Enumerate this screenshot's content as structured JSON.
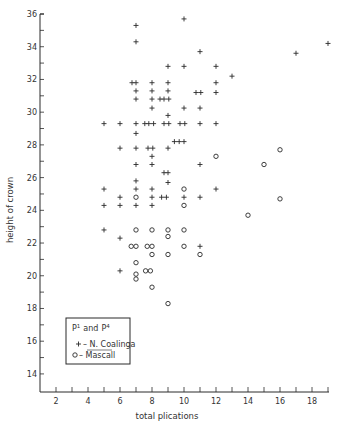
{
  "chart_data": {
    "type": "scatter",
    "title": "",
    "xlabel": "total plications",
    "ylabel": "height of crown",
    "xlim": [
      1,
      19
    ],
    "ylim": [
      12.9,
      36
    ],
    "xticks_labeled": [
      2,
      4,
      6,
      8,
      10,
      12,
      14,
      16,
      18
    ],
    "xticks_minor": [
      1,
      2,
      3,
      4,
      5,
      6,
      7,
      8,
      9,
      10,
      11,
      12,
      13,
      14,
      15,
      16,
      17,
      18,
      19
    ],
    "yticks_labeled": [
      14,
      16,
      18,
      20,
      22,
      24,
      26,
      28,
      30,
      32,
      34,
      36
    ],
    "yticks_minor": [
      14,
      15,
      16,
      17,
      18,
      19,
      20,
      21,
      22,
      23,
      24,
      25,
      26,
      27,
      28,
      29,
      30,
      31,
      32,
      33,
      34,
      35,
      36
    ],
    "grid": false,
    "legend": {
      "position": "lower-left",
      "title": "P1 and P4",
      "title_parts": {
        "p": "P",
        "sup1": "1",
        "and": "and",
        "sup2": "4"
      },
      "entries": [
        {
          "marker": "+",
          "label": "N. Coalinga"
        },
        {
          "marker": "o",
          "label": "Mascall"
        }
      ]
    },
    "series": [
      {
        "name": "N. Coalinga",
        "marker": "+",
        "points": [
          [
            7,
            35.3
          ],
          [
            7,
            34.3
          ],
          [
            10,
            35.7
          ],
          [
            11,
            33.7
          ],
          [
            17,
            33.6
          ],
          [
            19,
            34.2
          ],
          [
            9,
            32.8
          ],
          [
            10,
            32.8
          ],
          [
            12,
            32.8
          ],
          [
            13,
            32.2
          ],
          [
            6.75,
            31.8
          ],
          [
            7,
            31.8
          ],
          [
            8,
            31.8
          ],
          [
            9,
            31.8
          ],
          [
            12,
            31.8
          ],
          [
            7,
            31.3
          ],
          [
            8,
            31.3
          ],
          [
            9,
            31.3
          ],
          [
            10.75,
            31.2
          ],
          [
            11.05,
            31.2
          ],
          [
            12,
            31.2
          ],
          [
            7,
            30.8
          ],
          [
            8,
            30.8
          ],
          [
            8.5,
            30.8
          ],
          [
            8.75,
            30.8
          ],
          [
            9.05,
            30.8
          ],
          [
            8,
            30.25
          ],
          [
            10,
            30.25
          ],
          [
            11,
            30.25
          ],
          [
            9,
            29.8
          ],
          [
            5,
            29.3
          ],
          [
            6,
            29.3
          ],
          [
            7,
            29.3
          ],
          [
            7.55,
            29.3
          ],
          [
            7.8,
            29.3
          ],
          [
            8.1,
            29.3
          ],
          [
            8.75,
            29.3
          ],
          [
            9.05,
            29.3
          ],
          [
            9.75,
            29.3
          ],
          [
            10.05,
            29.3
          ],
          [
            11,
            29.3
          ],
          [
            12,
            29.3
          ],
          [
            7,
            28.7
          ],
          [
            9.4,
            28.2
          ],
          [
            9.7,
            28.2
          ],
          [
            10,
            28.2
          ],
          [
            6,
            27.8
          ],
          [
            7,
            27.8
          ],
          [
            7.75,
            27.8
          ],
          [
            8.05,
            27.8
          ],
          [
            9,
            27.8
          ],
          [
            8,
            27.3
          ],
          [
            7,
            26.8
          ],
          [
            8,
            26.8
          ],
          [
            11,
            26.8
          ],
          [
            8.75,
            26.3
          ],
          [
            9,
            26.3
          ],
          [
            7,
            25.8
          ],
          [
            9,
            25.7
          ],
          [
            5,
            25.3
          ],
          [
            7,
            25.3
          ],
          [
            8,
            25.3
          ],
          [
            12,
            25.3
          ],
          [
            6,
            24.8
          ],
          [
            8,
            24.8
          ],
          [
            8.6,
            24.8
          ],
          [
            8.9,
            24.8
          ],
          [
            10,
            24.8
          ],
          [
            11,
            24.8
          ],
          [
            5,
            24.3
          ],
          [
            6,
            24.3
          ],
          [
            7,
            24.3
          ],
          [
            8,
            24.3
          ],
          [
            5,
            22.8
          ],
          [
            6,
            22.3
          ],
          [
            11,
            21.8
          ],
          [
            6,
            20.3
          ]
        ]
      },
      {
        "name": "Mascall",
        "marker": "o",
        "points": [
          [
            7,
            24.8
          ],
          [
            10,
            25.3
          ],
          [
            10,
            24.3
          ],
          [
            12,
            27.3
          ],
          [
            16,
            27.7
          ],
          [
            15,
            26.8
          ],
          [
            16,
            24.7
          ],
          [
            14,
            23.7
          ],
          [
            7,
            22.8
          ],
          [
            8,
            22.8
          ],
          [
            9,
            22.8
          ],
          [
            10,
            22.8
          ],
          [
            9,
            22.4
          ],
          [
            6.7,
            21.8
          ],
          [
            7,
            21.8
          ],
          [
            7.7,
            21.8
          ],
          [
            8,
            21.8
          ],
          [
            10,
            21.8
          ],
          [
            8,
            21.3
          ],
          [
            9,
            21.3
          ],
          [
            11,
            21.3
          ],
          [
            7,
            20.8
          ],
          [
            7.6,
            20.3
          ],
          [
            7.9,
            20.3
          ],
          [
            7,
            20.1
          ],
          [
            7,
            19.8
          ],
          [
            8,
            19.3
          ],
          [
            9,
            18.3
          ]
        ]
      }
    ]
  },
  "colors": {
    "ink": "#2a2a2a",
    "background": "#ffffff"
  }
}
